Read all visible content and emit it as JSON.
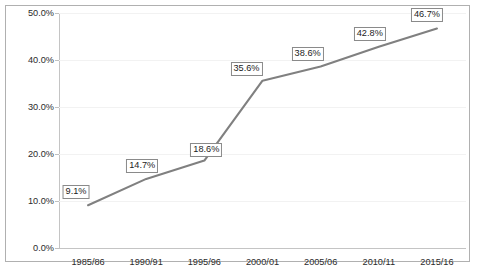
{
  "chart_data": {
    "type": "line",
    "title": "",
    "clipped_top_text": "",
    "xlabel": "",
    "ylabel": "",
    "categories": [
      "1985/86",
      "1990/91",
      "1995/96",
      "2000/01",
      "2005/06",
      "2010/11",
      "2015/16"
    ],
    "values": [
      9.1,
      14.7,
      18.6,
      35.6,
      38.6,
      42.8,
      46.7
    ],
    "data_labels": [
      "9.1%",
      "14.7%",
      "18.6%",
      "35.6%",
      "38.6%",
      "42.8%",
      "46.7%"
    ],
    "ylim": [
      0,
      50
    ],
    "ytick_values": [
      0,
      10,
      20,
      30,
      40,
      50
    ],
    "ytick_labels": [
      "0.0%",
      "10.0%",
      "20.0%",
      "30.0%",
      "40.0%",
      "50.0%"
    ],
    "grid": true,
    "legend": "none",
    "series_color": "#808080",
    "label_border_color": "#8a8a8a",
    "border_color": "#b0b0b0",
    "gridline_color": "#f2f2f2",
    "label_offsets": [
      {
        "dx": -12,
        "dy": -13
      },
      {
        "dx": -4,
        "dy": -13
      },
      {
        "dx": 2,
        "dy": -11
      },
      {
        "dx": -16,
        "dy": -12
      },
      {
        "dx": -13,
        "dy": -13
      },
      {
        "dx": -9,
        "dy": -13
      },
      {
        "dx": -10,
        "dy": -14
      }
    ]
  }
}
